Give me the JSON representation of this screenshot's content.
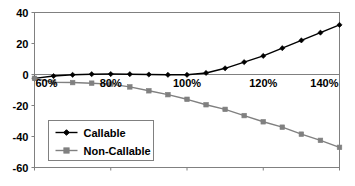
{
  "chart_data": {
    "type": "line",
    "title": "",
    "subtitle": "",
    "xlabel": "",
    "ylabel": "",
    "xlim": [
      60,
      140
    ],
    "ylim": [
      -60,
      40
    ],
    "grid": false,
    "legend_position": "lower-left-inside",
    "x_tick_labels": [
      "60%",
      "80%",
      "100%",
      "120%",
      "140%"
    ],
    "x_tick_values": [
      60,
      80,
      100,
      120,
      140
    ],
    "y_tick_labels": [
      "40",
      "20",
      "0",
      "-20",
      "-40",
      "-60"
    ],
    "y_tick_values": [
      40,
      20,
      0,
      -20,
      -40,
      -60
    ],
    "x": [
      60,
      65,
      70,
      75,
      80,
      85,
      90,
      95,
      100,
      105,
      110,
      115,
      120,
      125,
      130,
      135,
      140
    ],
    "series": [
      {
        "name": "Callable",
        "color": "#000000",
        "marker": "diamond",
        "values": [
          -2.5,
          -1.0,
          -0.2,
          0.2,
          0.3,
          0.2,
          0.0,
          -0.2,
          -0.2,
          1.0,
          4.0,
          8.0,
          12.0,
          17.0,
          22.0,
          27.0,
          32.0
        ]
      },
      {
        "name": "Non-Callable",
        "color": "#808080",
        "marker": "square",
        "values": [
          -2.5,
          -5.0,
          -5.2,
          -5.6,
          -6.2,
          -8.0,
          -10.5,
          -13.0,
          -16.0,
          -19.5,
          -22.5,
          -26.5,
          -30.5,
          -34.0,
          -38.5,
          -42.5,
          -47.0
        ]
      }
    ]
  },
  "legend": {
    "items": [
      {
        "label": "Callable",
        "color": "#000000",
        "marker": "diamond"
      },
      {
        "label": "Non-Callable",
        "color": "#808080",
        "marker": "square"
      }
    ]
  },
  "colors": {
    "callable": "#000000",
    "non_callable": "#808080",
    "axis": "#808080",
    "text": "#000000",
    "background": "#ffffff"
  }
}
